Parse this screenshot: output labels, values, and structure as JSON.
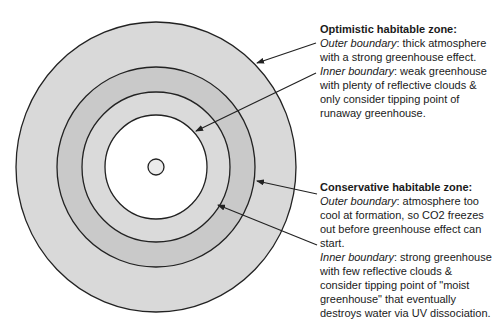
{
  "diagram": {
    "center": {
      "x": 156,
      "y": 167
    },
    "rings": [
      {
        "name": "optimistic-outer-zone",
        "rx": 140,
        "ry": 145,
        "fill": "#d9d9d9"
      },
      {
        "name": "conservative-zone",
        "rx": 99,
        "ry": 100,
        "fill": "#c9c9c9"
      },
      {
        "name": "optimistic-inner-zone",
        "rx": 74,
        "ry": 75,
        "fill": "#dadada"
      },
      {
        "name": "too-hot-zone",
        "rx": 51,
        "ry": 52,
        "fill": "#ffffff"
      },
      {
        "name": "star",
        "rx": 8,
        "ry": 8,
        "fill": "#ececec"
      }
    ],
    "stroke": "#222222",
    "arrows": [
      {
        "name": "optimistic-outer-arrow",
        "x1": 316,
        "y1": 43,
        "x2": 257,
        "y2": 63
      },
      {
        "name": "optimistic-inner-arrow",
        "x1": 316,
        "y1": 73,
        "x2": 196,
        "y2": 131
      },
      {
        "name": "conservative-outer-arrow",
        "x1": 317,
        "y1": 194,
        "x2": 257,
        "y2": 181
      },
      {
        "name": "conservative-inner-arrow",
        "x1": 317,
        "y1": 245,
        "x2": 218,
        "y2": 205
      }
    ]
  },
  "optimistic": {
    "title": "Optimistic habitable zone:",
    "outer_label": "Outer boundary",
    "outer_text_1": ": thick atmosphere",
    "outer_text_2": "with a strong greenhouse effect.",
    "inner_label": "Inner boundary",
    "inner_text_1": ": weak greenhouse",
    "inner_text_2": "with plenty of reflective clouds &",
    "inner_text_3": "only consider tipping point of",
    "inner_text_4": "runaway greenhouse."
  },
  "conservative": {
    "title": "Conservative habitable zone:",
    "outer_label": "Outer boundary",
    "outer_text_1": ": atmosphere too",
    "outer_text_2": "cool at formation, so CO2 freezes",
    "outer_text_3": "out before greenhouse effect can",
    "outer_text_4": "start.",
    "inner_label": "Inner boundary",
    "inner_text_1": ": strong greenhouse",
    "inner_text_2": "with few reflective clouds &",
    "inner_text_3": "consider tipping point of \"moist",
    "inner_text_4": "greenhouse\" that eventually",
    "inner_text_5": "destroys water via UV dissociation."
  }
}
